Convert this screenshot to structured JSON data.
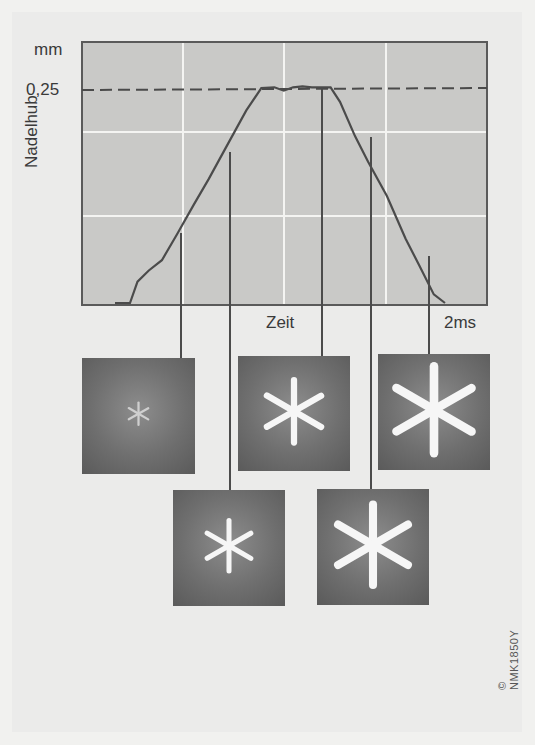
{
  "figure": {
    "y_unit": "mm",
    "y_tick_label": "0,25",
    "y_axis_label": "Nadelhub",
    "x_axis_label": "Zeit",
    "x_end_label": "2ms",
    "code_label": "© NMK1850Y"
  },
  "chart_data": {
    "type": "line",
    "title": "",
    "xlabel": "Zeit",
    "ylabel": "Nadelhub (mm)",
    "xlim": [
      0,
      2
    ],
    "ylim": [
      0,
      0.3
    ],
    "reference_line": {
      "y": 0.25,
      "style": "dashed",
      "label": "0,25"
    },
    "grid": true,
    "x": [
      0.0,
      0.08,
      0.12,
      0.18,
      0.25,
      0.33,
      0.42,
      0.5,
      0.6,
      0.7,
      0.78,
      0.85,
      0.9,
      0.95,
      1.0,
      1.05,
      1.1,
      1.15,
      1.2,
      1.28,
      1.35,
      1.45,
      1.55,
      1.62,
      1.7,
      1.76
    ],
    "values": [
      0,
      0,
      0.025,
      0.038,
      0.05,
      0.08,
      0.115,
      0.145,
      0.185,
      0.225,
      0.251,
      0.252,
      0.248,
      0.252,
      0.253,
      0.252,
      0.252,
      0.252,
      0.235,
      0.195,
      0.165,
      0.125,
      0.075,
      0.045,
      0.01,
      0
    ],
    "markers": [
      {
        "t": 0.33,
        "label": "spray image 1"
      },
      {
        "t": 0.6,
        "label": "spray image 2"
      },
      {
        "t": 1.05,
        "label": "spray image 3"
      },
      {
        "t": 1.28,
        "label": "spray image 4"
      },
      {
        "t": 1.6,
        "label": "spray image 5"
      }
    ]
  },
  "images": [
    {
      "name": "spray-photo-1",
      "jet_length": 0.22
    },
    {
      "name": "spray-photo-2",
      "jet_length": 0.5
    },
    {
      "name": "spray-photo-3",
      "jet_length": 0.62
    },
    {
      "name": "spray-photo-4",
      "jet_length": 0.72
    },
    {
      "name": "spray-photo-5",
      "jet_length": 0.86
    }
  ]
}
